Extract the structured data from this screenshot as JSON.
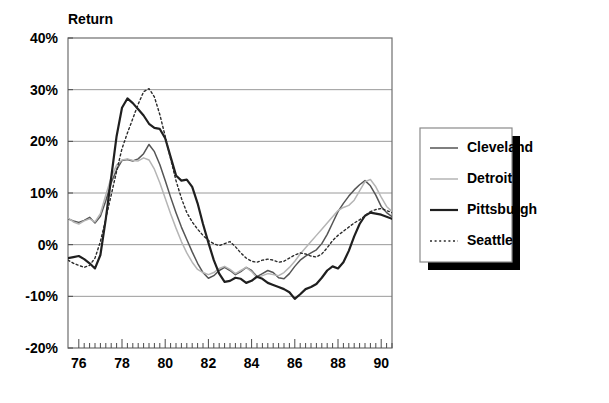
{
  "chart_data": {
    "type": "line",
    "title": "Return",
    "xlabel": "",
    "ylabel": "Return",
    "ylim": [
      -20,
      40
    ],
    "xlim": [
      1975.5,
      1990.5
    ],
    "grid": true,
    "legend_position": "right-outside",
    "ytick_labels": [
      "40%",
      "30%",
      "20%",
      "10%",
      "0%",
      "-10%",
      "-20%"
    ],
    "ytick_values": [
      40,
      30,
      20,
      10,
      0,
      -10,
      -20
    ],
    "xtick_labels": [
      "76",
      "78",
      "80",
      "82",
      "84",
      "86",
      "88",
      "90"
    ],
    "xtick_values": [
      1976,
      1978,
      1980,
      1982,
      1984,
      1986,
      1988,
      1990
    ],
    "minor_ticks_per_year": 4,
    "x": [
      1975.5,
      1975.75,
      1976,
      1976.25,
      1976.5,
      1976.75,
      1977,
      1977.25,
      1977.5,
      1977.75,
      1978,
      1978.25,
      1978.5,
      1978.75,
      1979,
      1979.25,
      1979.5,
      1979.75,
      1980,
      1980.25,
      1980.5,
      1980.75,
      1981,
      1981.25,
      1981.5,
      1981.75,
      1982,
      1982.25,
      1982.5,
      1982.75,
      1983,
      1983.25,
      1983.5,
      1983.75,
      1984,
      1984.25,
      1984.5,
      1984.75,
      1985,
      1985.25,
      1985.5,
      1985.75,
      1986,
      1986.25,
      1986.5,
      1986.75,
      1987,
      1987.25,
      1987.5,
      1987.75,
      1988,
      1988.25,
      1988.5,
      1988.75,
      1989,
      1989.25,
      1989.5,
      1989.75,
      1990,
      1990.25,
      1990.5
    ],
    "series": [
      {
        "name": "Cleveland",
        "color": "#555555",
        "width": 1.5,
        "dash": "none",
        "values": [
          5.0,
          4.6,
          4.3,
          4.7,
          5.3,
          4.2,
          5.5,
          8.5,
          12.0,
          14.5,
          16.3,
          16.5,
          16.2,
          16.6,
          17.6,
          19.4,
          18.0,
          15.5,
          12.4,
          9.2,
          6.2,
          3.4,
          1.0,
          -1.4,
          -3.6,
          -5.4,
          -6.5,
          -6.0,
          -5.0,
          -4.4,
          -5.0,
          -5.8,
          -5.2,
          -4.4,
          -5.0,
          -6.2,
          -5.6,
          -5.0,
          -5.4,
          -6.4,
          -6.6,
          -5.6,
          -4.2,
          -3.0,
          -2.2,
          -1.6,
          -1.0,
          0.2,
          2.0,
          4.2,
          6.4,
          8.0,
          9.4,
          10.6,
          11.6,
          12.4,
          11.4,
          9.6,
          7.4,
          6.2,
          5.4
        ]
      },
      {
        "name": "Detroit",
        "color": "#b5b5b5",
        "width": 1.5,
        "dash": "none",
        "values": [
          5.2,
          4.4,
          4.0,
          4.6,
          5.0,
          4.4,
          6.0,
          9.6,
          13.0,
          15.4,
          16.4,
          16.6,
          16.3,
          16.2,
          16.8,
          16.4,
          14.6,
          12.0,
          9.0,
          6.0,
          3.2,
          0.6,
          -1.6,
          -3.4,
          -4.8,
          -5.4,
          -5.8,
          -5.4,
          -4.6,
          -4.2,
          -4.8,
          -5.6,
          -5.0,
          -4.4,
          -5.2,
          -6.4,
          -6.0,
          -5.6,
          -5.8,
          -6.0,
          -5.4,
          -4.4,
          -3.2,
          -1.8,
          -0.6,
          0.6,
          1.8,
          3.0,
          4.2,
          5.4,
          6.6,
          7.2,
          7.6,
          8.6,
          10.4,
          12.2,
          12.6,
          11.2,
          9.2,
          7.4,
          6.4
        ]
      },
      {
        "name": "Pittsburgh",
        "color": "#1f1f1f",
        "width": 2.2,
        "dash": "none",
        "values": [
          -2.6,
          -2.4,
          -2.2,
          -2.8,
          -3.6,
          -4.6,
          -2.0,
          5.0,
          13.0,
          21.0,
          26.5,
          28.3,
          27.4,
          26.2,
          25.0,
          23.4,
          22.6,
          22.4,
          20.6,
          17.0,
          13.4,
          12.4,
          12.6,
          11.2,
          8.0,
          4.0,
          0.4,
          -3.0,
          -5.6,
          -7.2,
          -7.0,
          -6.4,
          -6.6,
          -7.4,
          -7.0,
          -6.2,
          -6.6,
          -7.4,
          -7.8,
          -8.2,
          -8.6,
          -9.2,
          -10.5,
          -9.6,
          -8.6,
          -8.2,
          -7.6,
          -6.4,
          -5.0,
          -4.2,
          -4.6,
          -3.4,
          -1.2,
          1.6,
          4.0,
          5.6,
          6.2,
          6.0,
          5.8,
          5.4,
          5.0
        ]
      },
      {
        "name": "Seattle",
        "color": "#2a2a2a",
        "width": 1.4,
        "dash": "2,2.6",
        "values": [
          -3.0,
          -3.6,
          -4.0,
          -4.4,
          -4.0,
          -2.6,
          0.6,
          5.0,
          9.6,
          14.2,
          18.6,
          21.6,
          24.4,
          27.2,
          29.6,
          30.2,
          28.6,
          25.2,
          21.0,
          16.6,
          12.4,
          9.0,
          6.2,
          4.4,
          3.0,
          1.8,
          0.8,
          0.2,
          -0.2,
          0.2,
          0.6,
          -0.4,
          -1.6,
          -2.6,
          -3.2,
          -3.4,
          -3.0,
          -2.8,
          -3.0,
          -3.4,
          -3.2,
          -2.6,
          -2.0,
          -1.6,
          -1.8,
          -2.2,
          -2.4,
          -1.8,
          -0.6,
          0.8,
          1.8,
          2.6,
          3.4,
          4.2,
          4.8,
          5.6,
          6.4,
          6.8,
          7.0,
          6.6,
          6.2
        ]
      }
    ]
  },
  "legend": {
    "items": [
      {
        "label": "Cleveland"
      },
      {
        "label": "Detroit"
      },
      {
        "label": "Pittsburgh"
      },
      {
        "label": "Seattle"
      }
    ]
  }
}
